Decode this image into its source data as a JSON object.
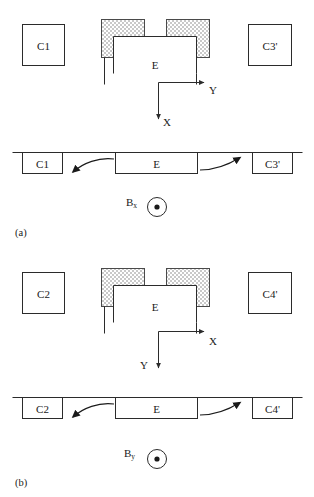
{
  "figure": {
    "type": "schematic-diagram",
    "stroke_color": "#2b2b2b",
    "shade_color": "#cfcfcf",
    "background": "#ffffff"
  },
  "panels": [
    {
      "tag": "(a)",
      "cross_section": {
        "left_box_label": "C1",
        "right_box_label": "C3'",
        "core_label": "E",
        "axes": {
          "horizontal_label": "Y",
          "vertical_label": "X"
        },
        "pole_pieces": [
          "left-pole-piece",
          "right-pole-piece"
        ]
      },
      "plan_view": {
        "boxes": [
          "C1",
          "E",
          "C3'"
        ],
        "field_symbol": {
          "base": "B",
          "subscript": "x",
          "direction_marker": "out-of-page-dot"
        },
        "arrows": [
          "left-curved-arrow",
          "right-curved-arrow"
        ]
      }
    },
    {
      "tag": "(b)",
      "cross_section": {
        "left_box_label": "C2",
        "right_box_label": "C4'",
        "core_label": "E",
        "axes": {
          "horizontal_label": "X",
          "vertical_label": "Y"
        },
        "pole_pieces": [
          "left-pole-piece",
          "right-pole-piece"
        ]
      },
      "plan_view": {
        "boxes": [
          "C2",
          "E",
          "C4'"
        ],
        "field_symbol": {
          "base": "B",
          "subscript": "y",
          "direction_marker": "out-of-page-dot"
        },
        "arrows": [
          "left-curved-arrow",
          "right-curved-arrow"
        ]
      }
    }
  ]
}
